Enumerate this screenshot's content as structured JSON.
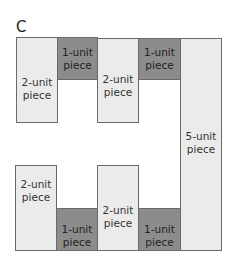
{
  "title": "C",
  "pieces": [
    {
      "label": "2-unit\npiece",
      "units": 2,
      "shade": "light"
    },
    {
      "label": "1-unit\npiece",
      "units": 1,
      "shade": "dark"
    },
    {
      "label": "2-unit\npiece",
      "units": 2,
      "shade": "light"
    },
    {
      "label": "1-unit\npiece",
      "units": 1,
      "shade": "dark"
    },
    {
      "label": "5-unit\npiece",
      "units": 5,
      "shade": "light"
    },
    {
      "label": "2-unit\npiece",
      "units": 2,
      "shade": "light"
    },
    {
      "label": "1-unit\npiece",
      "units": 1,
      "shade": "dark"
    },
    {
      "label": "2-unit\npiece",
      "units": 2,
      "shade": "light"
    },
    {
      "label": "1-unit\npiece",
      "units": 1,
      "shade": "dark"
    }
  ],
  "colors": {
    "light": "#ebebeb",
    "dark": "#8c8c8c",
    "border": "#6a6a6a"
  }
}
